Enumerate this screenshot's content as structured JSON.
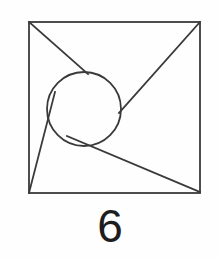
{
  "figure": {
    "caption": "6",
    "background_color": "#fefefe",
    "stroke_color": "#3a3a3a",
    "caption_color": "#1d1d1d",
    "stroke_width": 1.8,
    "square": {
      "name": "outer-square",
      "left": 29,
      "top": 22,
      "right": 200,
      "bottom": 193,
      "width": 171,
      "height": 171
    },
    "circle": {
      "name": "inscribed-circle",
      "center_x": 84,
      "center_y": 109,
      "radius": 37,
      "top": 72,
      "bottom": 146,
      "left": 47,
      "right": 121
    },
    "lines": [
      {
        "name": "line-top-left-to-circle",
        "from_x": 29,
        "from_y": 22,
        "to_x": 88,
        "to_y": 74
      },
      {
        "name": "line-top-right-to-circle",
        "from_x": 200,
        "from_y": 22,
        "to_x": 119,
        "to_y": 113
      },
      {
        "name": "line-bottom-left-to-circle",
        "from_x": 29,
        "from_y": 193,
        "to_x": 55,
        "to_y": 92
      },
      {
        "name": "line-bottom-left-to-bottom-right",
        "from_x": 29,
        "from_y": 193,
        "to_x": 200,
        "to_y": 193
      },
      {
        "name": "line-diagonal-circle-to-bottom-right",
        "from_x": 67,
        "from_y": 136,
        "to_x": 200,
        "to_y": 192
      }
    ]
  }
}
